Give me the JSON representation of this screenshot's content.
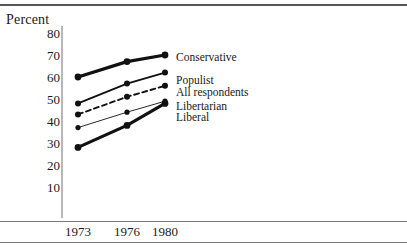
{
  "figure": {
    "y_axis_title": "Percent"
  },
  "chart_data": {
    "type": "line",
    "title": "",
    "xlabel": "",
    "ylabel": "Percent",
    "x": [
      1973,
      1976,
      1980
    ],
    "xtick_labels": [
      "1973",
      "1976",
      "1980"
    ],
    "ytick_labels": [
      "80",
      "70",
      "60",
      "50",
      "40",
      "30",
      "20",
      "10"
    ],
    "yticks": [
      80,
      70,
      60,
      50,
      40,
      30,
      20,
      10
    ],
    "ylim": [
      0,
      85
    ],
    "xlim": [
      1971.5,
      1981.5
    ],
    "grid": false,
    "legend_position": "right-inline",
    "series": [
      {
        "name": "Conservative",
        "values": [
          60,
          67,
          70
        ],
        "style": "solid",
        "width": "thick",
        "color": "#111111"
      },
      {
        "name": "Populist",
        "values": [
          48,
          57,
          62
        ],
        "style": "solid",
        "width": "medium",
        "color": "#111111"
      },
      {
        "name": "All respondents",
        "values": [
          43,
          51,
          56
        ],
        "style": "dashed",
        "width": "medium",
        "color": "#111111"
      },
      {
        "name": "Libertarian",
        "values": [
          37,
          44,
          49
        ],
        "style": "solid",
        "width": "thin",
        "color": "#111111"
      },
      {
        "name": "Liberal",
        "values": [
          28,
          38,
          48
        ],
        "style": "solid",
        "width": "thick",
        "color": "#111111"
      }
    ]
  },
  "colors": {
    "ink": "#111111",
    "rule": "#7a7a7a",
    "axis": "#888888"
  }
}
